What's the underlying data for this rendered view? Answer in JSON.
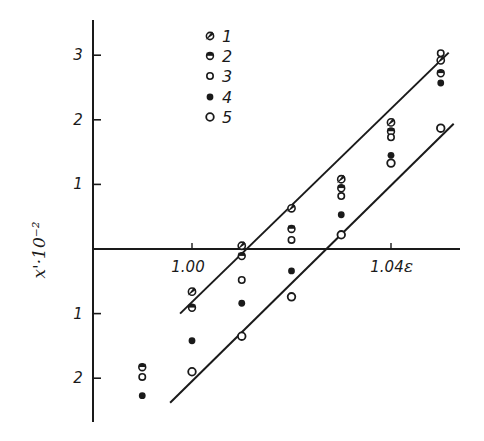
{
  "chart_data": {
    "type": "scatter",
    "title": "",
    "xlabel": "ε",
    "ylabel": "x'·10⁻²",
    "xlim": [
      0.98,
      1.053
    ],
    "ylim": [
      -2.7,
      3.5
    ],
    "grid": false,
    "legend_position": "upper-left-inside",
    "x_ticks": [
      1.0,
      1.04
    ],
    "x_tick_labels": [
      "1.00",
      "1.04"
    ],
    "y_ticks": [
      -2,
      -1,
      1,
      2,
      3
    ],
    "y_tick_labels": [
      "2",
      "1",
      "1",
      "2",
      "3"
    ],
    "series": [
      {
        "name": "1",
        "marker": "half-filled-slanted",
        "x": [
          1.0,
          1.01,
          1.02,
          1.03,
          1.04,
          1.05
        ],
        "y": [
          -0.66,
          0.05,
          0.63,
          1.08,
          1.96,
          2.92
        ]
      },
      {
        "name": "2",
        "marker": "circle-dot",
        "x": [
          0.99,
          1.0,
          1.01,
          1.02,
          1.03,
          1.04,
          1.05
        ],
        "y": [
          -1.83,
          -0.91,
          -0.11,
          0.31,
          0.94,
          1.82,
          2.72
        ]
      },
      {
        "name": "3",
        "marker": "open-circle-small",
        "x": [
          0.99,
          1.01,
          1.02,
          1.03,
          1.04,
          1.05
        ],
        "y": [
          -1.98,
          -0.48,
          0.14,
          0.82,
          1.73,
          3.03
        ]
      },
      {
        "name": "4",
        "marker": "filled-circle",
        "x": [
          0.99,
          1.0,
          1.01,
          1.02,
          1.03,
          1.04,
          1.05
        ],
        "y": [
          -2.27,
          -1.42,
          -0.84,
          -0.34,
          0.53,
          1.45,
          2.57
        ]
      },
      {
        "name": "5",
        "marker": "open-circle",
        "x": [
          1.0,
          1.01,
          1.02,
          1.03,
          1.04,
          1.05
        ],
        "y": [
          -1.9,
          -1.35,
          -0.74,
          0.22,
          1.33,
          1.87
        ]
      }
    ],
    "fit_lines": [
      {
        "name": "upper",
        "x": [
          0.9976,
          1.0516
        ],
        "y": [
          -1.0,
          3.04
        ]
      },
      {
        "name": "lower",
        "x": [
          0.9956,
          1.0526
        ],
        "y": [
          -2.38,
          1.94
        ]
      }
    ],
    "legend": [
      "1",
      "2",
      "3",
      "4",
      "5"
    ]
  }
}
